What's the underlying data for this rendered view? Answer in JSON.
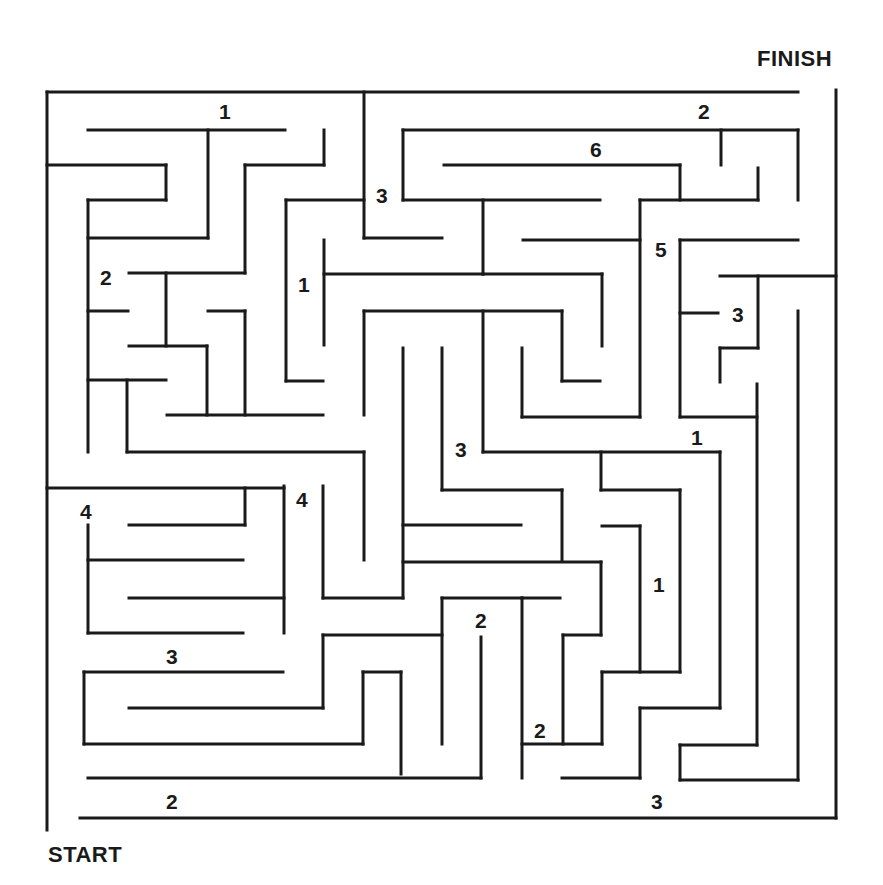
{
  "puzzle": {
    "start_label": "START",
    "finish_label": "FINISH",
    "wall_color": "#1a1a1a",
    "background_color": "#ffffff",
    "wall_width": 3
  },
  "numbers": [
    {
      "value": "1",
      "x": 225,
      "y": 112
    },
    {
      "value": "2",
      "x": 704,
      "y": 112
    },
    {
      "value": "6",
      "x": 596,
      "y": 150
    },
    {
      "value": "3",
      "x": 382,
      "y": 196
    },
    {
      "value": "5",
      "x": 661,
      "y": 250
    },
    {
      "value": "2",
      "x": 106,
      "y": 278
    },
    {
      "value": "1",
      "x": 304,
      "y": 285
    },
    {
      "value": "3",
      "x": 738,
      "y": 315
    },
    {
      "value": "1",
      "x": 697,
      "y": 438
    },
    {
      "value": "3",
      "x": 461,
      "y": 450
    },
    {
      "value": "4",
      "x": 302,
      "y": 500
    },
    {
      "value": "4",
      "x": 86,
      "y": 512
    },
    {
      "value": "1",
      "x": 659,
      "y": 585
    },
    {
      "value": "2",
      "x": 481,
      "y": 621
    },
    {
      "value": "3",
      "x": 172,
      "y": 657
    },
    {
      "value": "2",
      "x": 540,
      "y": 731
    },
    {
      "value": "2",
      "x": 172,
      "y": 802
    },
    {
      "value": "3",
      "x": 657,
      "y": 802
    }
  ],
  "walls": [
    [
      47,
      92,
      47,
      830
    ],
    [
      47,
      92,
      798,
      92
    ],
    [
      836,
      90,
      836,
      818
    ],
    [
      80,
      818,
      836,
      818
    ],
    [
      88,
      130,
      285,
      130
    ],
    [
      208,
      130,
      208,
      238
    ],
    [
      47,
      165,
      166,
      165
    ],
    [
      166,
      165,
      166,
      200
    ],
    [
      88,
      200,
      166,
      200
    ],
    [
      88,
      200,
      88,
      452
    ],
    [
      88,
      238,
      208,
      238
    ],
    [
      324,
      130,
      324,
      165
    ],
    [
      245,
      165,
      324,
      165
    ],
    [
      245,
      165,
      245,
      273
    ],
    [
      129,
      273,
      245,
      273
    ],
    [
      166,
      273,
      166,
      346
    ],
    [
      88,
      311,
      128,
      311
    ],
    [
      129,
      346,
      207,
      346
    ],
    [
      207,
      346,
      207,
      415
    ],
    [
      208,
      311,
      245,
      311
    ],
    [
      245,
      311,
      245,
      415
    ],
    [
      167,
      415,
      323,
      415
    ],
    [
      88,
      380,
      166,
      380
    ],
    [
      127,
      380,
      127,
      452
    ],
    [
      127,
      452,
      364,
      452
    ],
    [
      364,
      452,
      364,
      560
    ],
    [
      364,
      92,
      364,
      238
    ],
    [
      364,
      238,
      442,
      238
    ],
    [
      286,
      200,
      364,
      200
    ],
    [
      286,
      200,
      286,
      381
    ],
    [
      286,
      381,
      323,
      381
    ],
    [
      324,
      240,
      324,
      345
    ],
    [
      324,
      274,
      483,
      274
    ],
    [
      483,
      200,
      483,
      274
    ],
    [
      403,
      200,
      600,
      200
    ],
    [
      403,
      130,
      403,
      200
    ],
    [
      403,
      130,
      798,
      130
    ],
    [
      721,
      130,
      721,
      165
    ],
    [
      798,
      130,
      798,
      200
    ],
    [
      444,
      165,
      680,
      165
    ],
    [
      680,
      165,
      680,
      200
    ],
    [
      640,
      200,
      758,
      200
    ],
    [
      758,
      168,
      758,
      200
    ],
    [
      640,
      200,
      640,
      417
    ],
    [
      483,
      274,
      602,
      274
    ],
    [
      602,
      274,
      602,
      346
    ],
    [
      523,
      240,
      640,
      240
    ],
    [
      364,
      311,
      562,
      311
    ],
    [
      364,
      311,
      364,
      415
    ],
    [
      483,
      311,
      483,
      452
    ],
    [
      562,
      311,
      562,
      381
    ],
    [
      562,
      381,
      600,
      381
    ],
    [
      522,
      348,
      522,
      417
    ],
    [
      522,
      417,
      640,
      417
    ],
    [
      403,
      348,
      403,
      598
    ],
    [
      442,
      348,
      442,
      490
    ],
    [
      442,
      490,
      562,
      490
    ],
    [
      562,
      490,
      562,
      560
    ],
    [
      483,
      452,
      720,
      452
    ],
    [
      601,
      452,
      601,
      490
    ],
    [
      601,
      490,
      680,
      490
    ],
    [
      680,
      490,
      680,
      672
    ],
    [
      680,
      240,
      798,
      240
    ],
    [
      680,
      240,
      680,
      417
    ],
    [
      680,
      417,
      757,
      417
    ],
    [
      720,
      276,
      836,
      276
    ],
    [
      758,
      276,
      758,
      348
    ],
    [
      680,
      313,
      718,
      313
    ],
    [
      720,
      348,
      758,
      348
    ],
    [
      720,
      348,
      720,
      382
    ],
    [
      757,
      384,
      757,
      745
    ],
    [
      798,
      311,
      798,
      780
    ],
    [
      720,
      452,
      720,
      708
    ],
    [
      47,
      488,
      284,
      488
    ],
    [
      245,
      488,
      245,
      525
    ],
    [
      129,
      525,
      245,
      525
    ],
    [
      284,
      486,
      284,
      633
    ],
    [
      88,
      525,
      88,
      633
    ],
    [
      88,
      560,
      243,
      560
    ],
    [
      129,
      598,
      284,
      598
    ],
    [
      88,
      633,
      243,
      633
    ],
    [
      323,
      486,
      323,
      598
    ],
    [
      323,
      598,
      403,
      598
    ],
    [
      403,
      525,
      521,
      525
    ],
    [
      403,
      562,
      601,
      562
    ],
    [
      601,
      562,
      601,
      635
    ],
    [
      563,
      635,
      601,
      635
    ],
    [
      563,
      635,
      563,
      744
    ],
    [
      522,
      598,
      560,
      598
    ],
    [
      602,
      526,
      640,
      526
    ],
    [
      640,
      526,
      640,
      672
    ],
    [
      602,
      672,
      680,
      672
    ],
    [
      602,
      672,
      602,
      744
    ],
    [
      522,
      744,
      602,
      744
    ],
    [
      522,
      598,
      522,
      778
    ],
    [
      442,
      598,
      522,
      598
    ],
    [
      442,
      598,
      442,
      744
    ],
    [
      323,
      635,
      442,
      635
    ],
    [
      323,
      635,
      323,
      708
    ],
    [
      129,
      708,
      323,
      708
    ],
    [
      84,
      672,
      283,
      672
    ],
    [
      84,
      672,
      84,
      744
    ],
    [
      84,
      744,
      363,
      744
    ],
    [
      363,
      672,
      363,
      744
    ],
    [
      363,
      672,
      401,
      672
    ],
    [
      401,
      672,
      401,
      774
    ],
    [
      481,
      637,
      481,
      778
    ],
    [
      88,
      778,
      481,
      778
    ],
    [
      640,
      708,
      720,
      708
    ],
    [
      640,
      708,
      640,
      778
    ],
    [
      562,
      778,
      640,
      778
    ],
    [
      680,
      745,
      757,
      745
    ],
    [
      680,
      745,
      680,
      780
    ],
    [
      680,
      780,
      798,
      780
    ]
  ]
}
